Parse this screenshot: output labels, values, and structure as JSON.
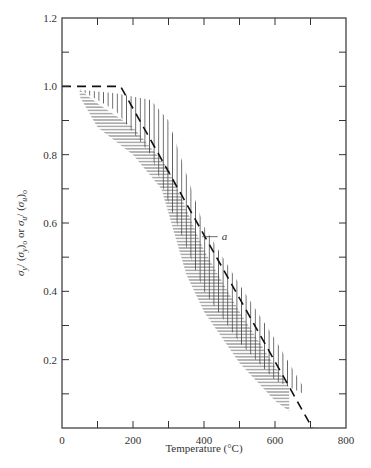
{
  "chart_data": {
    "type": "line",
    "title": "",
    "xlabel": "Temperature (°C)",
    "ylabel": "σy/(σy)0  or  σu/(σu)0",
    "xlim": [
      0,
      800
    ],
    "ylim": [
      0,
      1.2
    ],
    "x_ticks": [
      0,
      200,
      400,
      600,
      800
    ],
    "x_minor_ticks": [
      100,
      300,
      500,
      700
    ],
    "y_ticks": [
      0,
      0.2,
      0.4,
      0.6,
      0.8,
      1.0,
      1.2
    ],
    "y_tick_labels": [
      "0",
      "0.2",
      "0.4",
      "0.6",
      "0.8",
      "1.0",
      "1.2"
    ],
    "y_minor_ticks": [
      0.1,
      0.3,
      0.5,
      0.7,
      0.9,
      1.1
    ],
    "grid": false,
    "series": [
      {
        "name": "a",
        "style": "dashed",
        "x": [
          0,
          165,
          705
        ],
        "y": [
          1.0,
          1.0,
          0.0
        ]
      },
      {
        "name": "yield-strength-band",
        "style": "horizontal-hatch",
        "upper": {
          "x": [
            50,
            100,
            200,
            300,
            400,
            500,
            600,
            640
          ],
          "y": [
            0.99,
            0.95,
            0.88,
            0.76,
            0.52,
            0.34,
            0.18,
            0.12
          ]
        },
        "lower": {
          "x": [
            50,
            100,
            200,
            280,
            350,
            400,
            500,
            600,
            640
          ],
          "y": [
            0.97,
            0.88,
            0.8,
            0.7,
            0.45,
            0.34,
            0.19,
            0.08,
            0.05
          ]
        }
      },
      {
        "name": "ultimate-strength-band",
        "style": "vertical-hatch",
        "upper": {
          "x": [
            50,
            150,
            250,
            300,
            400,
            500,
            600,
            680
          ],
          "y": [
            0.99,
            0.98,
            0.96,
            0.9,
            0.59,
            0.42,
            0.26,
            0.12
          ]
        },
        "lower": {
          "x": [
            50,
            150,
            250,
            300,
            400,
            500,
            600,
            680
          ],
          "y": [
            0.99,
            0.93,
            0.8,
            0.66,
            0.4,
            0.25,
            0.14,
            0.1
          ]
        }
      }
    ],
    "annotations": [
      {
        "text": "a",
        "x": 450,
        "y": 0.56,
        "arrow_to": {
          "x": 395,
          "y": 0.56
        }
      }
    ],
    "legend": null
  },
  "labels": {
    "xlabel": "Temperature (°C)",
    "x_ticks": [
      "0",
      "200",
      "400",
      "600",
      "800"
    ],
    "y_ticks": [
      "0",
      "0.2",
      "0.4",
      "0.6",
      "0.8",
      "1.0",
      "1.2"
    ],
    "annotation_a": "a"
  }
}
